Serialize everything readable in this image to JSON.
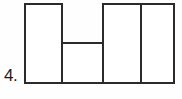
{
  "figure": {
    "label": "4.",
    "caption_number": "4",
    "background_color": "#fefefe",
    "line_color": "#2b2b2b",
    "line_width_px": 2,
    "canvas": {
      "width": 182,
      "height": 99
    }
  },
  "geometry": {
    "bounds": {
      "left": 25,
      "top": 4,
      "right": 175,
      "bottom": 83
    },
    "vertical_lines": [
      {
        "name": "outer-left-edge",
        "x": 25,
        "y1": 4,
        "y2": 83
      },
      {
        "name": "inner-divider-1",
        "x": 62,
        "y1": 4,
        "y2": 83
      },
      {
        "name": "inner-divider-2",
        "x": 103,
        "y1": 4,
        "y2": 83
      },
      {
        "name": "inner-divider-3",
        "x": 141,
        "y1": 4,
        "y2": 83
      },
      {
        "name": "outer-right-edge",
        "x": 174,
        "y1": 4,
        "y2": 83
      }
    ],
    "horizontal_lines": [
      {
        "name": "top-edge-left-segment",
        "y": 4,
        "x1": 25,
        "x2": 62
      },
      {
        "name": "top-edge-right-segment",
        "y": 4,
        "x1": 103,
        "x2": 174
      },
      {
        "name": "notch-bottom-divider",
        "y": 43,
        "x1": 62,
        "x2": 103
      },
      {
        "name": "bottom-edge",
        "y": 83,
        "x1": 25,
        "x2": 174
      }
    ],
    "notch": {
      "left": 62,
      "right": 103,
      "top": 4,
      "bottom": 43
    }
  },
  "regions": [
    {
      "name": "rect-1-left-tall",
      "x": 25,
      "y": 4,
      "width": 37,
      "height": 79
    },
    {
      "name": "rect-2-center-short",
      "x": 62,
      "y": 43,
      "width": 41,
      "height": 40
    },
    {
      "name": "rect-3-right-tall",
      "x": 103,
      "y": 4,
      "width": 38,
      "height": 79
    },
    {
      "name": "rect-4-far-right-tall",
      "x": 141,
      "y": 4,
      "width": 33,
      "height": 79
    }
  ]
}
